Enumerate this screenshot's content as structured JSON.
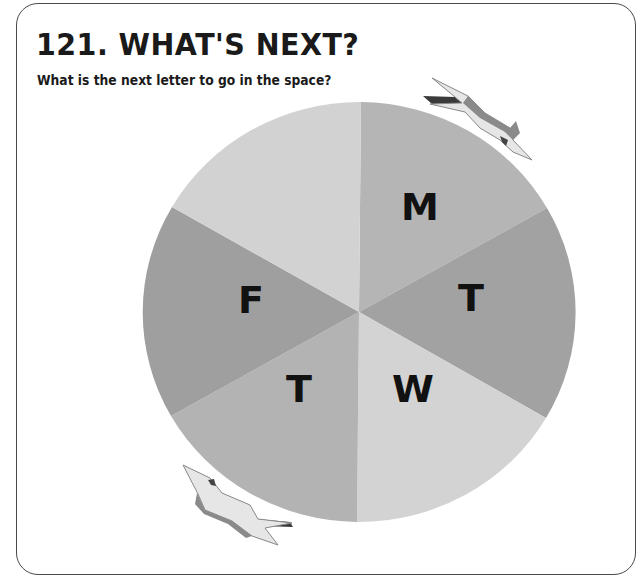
{
  "header": {
    "title": "121. WHAT'S NEXT?",
    "subtitle": "What is the next letter to go in the space?"
  },
  "wheel": {
    "sectors": [
      {
        "position": "top-right",
        "letter": "M",
        "color": "#b5b5b5"
      },
      {
        "position": "right",
        "letter": "T",
        "color": "#a2a2a2"
      },
      {
        "position": "bottom-right",
        "letter": "W",
        "color": "#d3d3d3"
      },
      {
        "position": "bottom-left",
        "letter": "T",
        "color": "#b3b3b3"
      },
      {
        "position": "left",
        "letter": "F",
        "color": "#9f9f9f"
      },
      {
        "position": "top-left",
        "letter": "",
        "color": "#d2d2d2"
      }
    ],
    "direction_arrows": [
      "clockwise-arrow-top-right",
      "counterclockwise-arrow-bottom-left"
    ]
  },
  "colors": {
    "frame_border": "#4a4a4a",
    "text": "#1a1a1a",
    "arrow_fill": "#e4e4e4",
    "arrow_shade": "#555555"
  }
}
